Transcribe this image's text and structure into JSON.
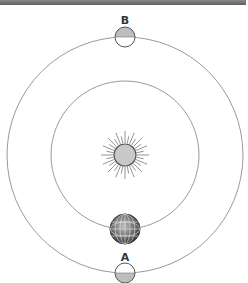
{
  "diagram": {
    "labels": {
      "moon_top": "B",
      "moon_bottom": "A"
    },
    "elements": [
      {
        "id": "sun",
        "type": "sun",
        "center": [
          125,
          155
        ],
        "radius": 11
      },
      {
        "id": "inner-orbit",
        "type": "orbit",
        "center": [
          125,
          155
        ],
        "radius": 74
      },
      {
        "id": "outer-orbit",
        "type": "orbit",
        "center": [
          125,
          155
        ],
        "radius": 118
      },
      {
        "id": "earth",
        "type": "planet",
        "center": [
          125,
          229
        ],
        "radius": 15
      },
      {
        "id": "moon-b",
        "type": "moon",
        "label": "B",
        "center": [
          125,
          37
        ],
        "radius": 10,
        "shaded_half": "top"
      },
      {
        "id": "moon-a",
        "type": "moon",
        "label": "A",
        "center": [
          125,
          273
        ],
        "radius": 10,
        "shaded_half": "bottom"
      }
    ],
    "colors": {
      "orbit": "#9a9a9a",
      "sun_fill": "#c8c8c8",
      "moon_shade": "#bdbdbd",
      "earth_dark": "#3a3a3a",
      "earth_light": "#bdbdbd"
    }
  }
}
